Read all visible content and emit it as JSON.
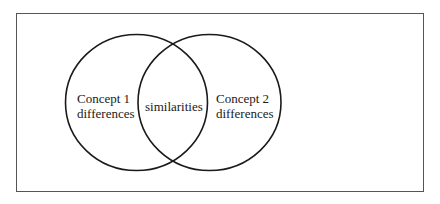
{
  "diagram": {
    "type": "venn",
    "left_set": {
      "line1": "Concept 1",
      "line2": "differences"
    },
    "overlap": {
      "label": "similarities"
    },
    "right_set": {
      "line1": "Concept 2",
      "line2": "differences"
    }
  },
  "colors": {
    "stroke": "#1a1a1a",
    "frame": "#555555",
    "background": "#ffffff"
  }
}
